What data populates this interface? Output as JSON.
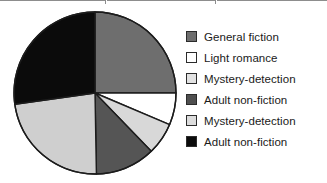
{
  "chart_data": {
    "type": "pie",
    "title": "",
    "subtitle": "",
    "xlabel": "",
    "ylabel": "",
    "grid": false,
    "legend_position": "right",
    "start_angle_deg": 0,
    "direction": "clockwise",
    "center": {
      "x": 95,
      "y": 93
    },
    "radius": 81,
    "categories": [
      "General fiction",
      "Light romance",
      "Mystery-detection",
      "Adult non-fiction",
      "Mystery-detection",
      "Adult non-fiction"
    ],
    "values": [
      25,
      6.4,
      6.4,
      12,
      23,
      27.2
    ],
    "angles_deg": [
      90,
      23,
      23,
      43,
      83,
      98
    ],
    "colors": [
      "#6e6e6e",
      "#ffffff",
      "#d8d8d8",
      "#555555",
      "#cfcfcf",
      "#0b0b0b"
    ],
    "series": [
      {
        "name": "Book loans by category",
        "values": [
          25,
          6.4,
          6.4,
          12,
          23,
          27.2
        ]
      }
    ],
    "slices": [
      {
        "label": "General fiction",
        "angle_deg": 90,
        "percent": 25,
        "color": "#6e6e6e",
        "swatch_fill": "#6e6e6e"
      },
      {
        "label": "Light romance",
        "angle_deg": 23,
        "percent": 6.4,
        "color": "#ffffff",
        "swatch_fill": "#ffffff"
      },
      {
        "label": "Mystery-detection",
        "angle_deg": 23,
        "percent": 6.4,
        "color": "#d8d8d8",
        "swatch_fill": "#e2e2e2"
      },
      {
        "label": "Adult non-fiction",
        "angle_deg": 43,
        "percent": 12,
        "color": "#555555",
        "swatch_fill": "#4f4f4f"
      },
      {
        "label": "Mystery-detection",
        "angle_deg": 83,
        "percent": 23,
        "color": "#cfcfcf",
        "swatch_fill": "#dcdcdc"
      },
      {
        "label": "Adult non-fiction",
        "angle_deg": 98,
        "percent": 27.2,
        "color": "#0b0b0b",
        "swatch_fill": "#0b0b0b"
      }
    ]
  },
  "pie": {
    "outline_color": "#1c1c1c",
    "outline_width": 1.4
  },
  "legend": {
    "items": [
      {
        "label": "General fiction"
      },
      {
        "label": "Light romance"
      },
      {
        "label": "Mystery-detection"
      },
      {
        "label": "Adult non-fiction"
      },
      {
        "label": "Mystery-detection"
      },
      {
        "label": "Adult non-fiction"
      }
    ]
  }
}
